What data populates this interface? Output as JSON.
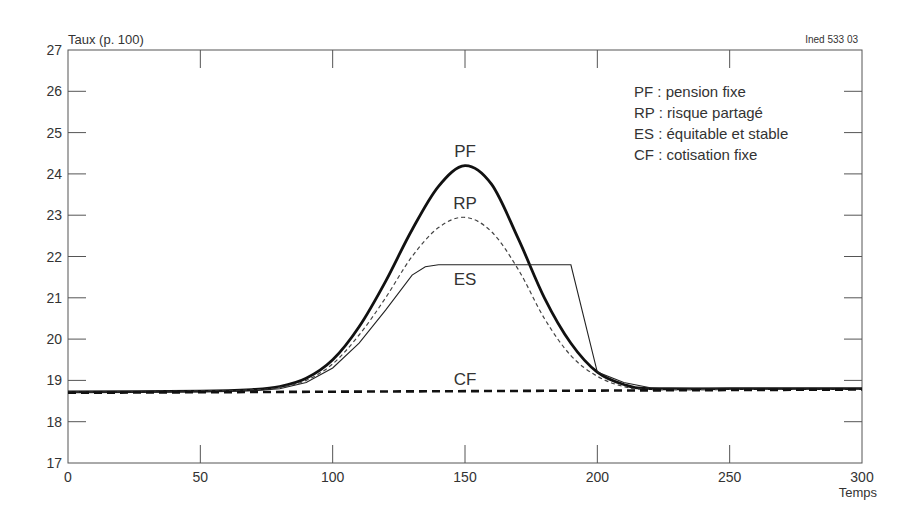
{
  "chart_data": {
    "type": "line",
    "title": "",
    "ylabel": "Taux (p. 100)",
    "xlabel": "Temps",
    "source_note": "Ined 533 03",
    "xlim": [
      0,
      300
    ],
    "ylim": [
      17,
      27
    ],
    "xticks": [
      0,
      50,
      100,
      150,
      200,
      250,
      300
    ],
    "yticks": [
      17,
      18,
      19,
      20,
      21,
      22,
      23,
      24,
      25,
      26,
      27
    ],
    "grid": false,
    "legend_position": "top-right",
    "legend": [
      "PF : pension fixe",
      "RP : risque partagé",
      "ES : équitable et stable",
      "CF : cotisation fixe"
    ],
    "series": [
      {
        "name": "PF",
        "label": "pension fixe",
        "style": "thick-solid",
        "x": [
          0,
          50,
          70,
          80,
          90,
          100,
          110,
          120,
          130,
          140,
          150,
          160,
          170,
          180,
          190,
          200,
          210,
          220,
          250,
          300
        ],
        "values": [
          18.72,
          18.74,
          18.78,
          18.85,
          19.05,
          19.5,
          20.3,
          21.4,
          22.65,
          23.7,
          24.2,
          23.75,
          22.45,
          21.0,
          19.9,
          19.2,
          18.9,
          18.8,
          18.8,
          18.8
        ]
      },
      {
        "name": "RP",
        "label": "risque partagé",
        "style": "thin-dashed",
        "x": [
          0,
          50,
          70,
          80,
          90,
          100,
          110,
          120,
          130,
          140,
          150,
          160,
          170,
          180,
          190,
          200,
          210,
          220,
          250,
          300
        ],
        "values": [
          18.72,
          18.74,
          18.77,
          18.83,
          19.0,
          19.4,
          20.1,
          21.0,
          22.0,
          22.7,
          22.95,
          22.6,
          21.7,
          20.5,
          19.6,
          19.1,
          18.85,
          18.78,
          18.78,
          18.78
        ]
      },
      {
        "name": "ES",
        "label": "équitable et stable",
        "style": "thin-solid",
        "x": [
          0,
          50,
          70,
          80,
          90,
          100,
          110,
          120,
          130,
          135,
          140,
          150,
          160,
          170,
          180,
          190,
          200,
          210,
          220,
          250,
          300
        ],
        "values": [
          18.72,
          18.73,
          18.75,
          18.8,
          18.95,
          19.3,
          19.9,
          20.7,
          21.55,
          21.75,
          21.8,
          21.8,
          21.8,
          21.8,
          21.8,
          21.8,
          19.2,
          18.95,
          18.82,
          18.8,
          18.8
        ]
      },
      {
        "name": "CF",
        "label": "cotisation fixe",
        "style": "thick-dashed",
        "x": [
          0,
          300
        ],
        "values": [
          18.7,
          18.78
        ]
      }
    ],
    "annotations": [
      {
        "text": "PF",
        "x": 150,
        "y": 24.4
      },
      {
        "text": "RP",
        "x": 150,
        "y": 23.15
      },
      {
        "text": "ES",
        "x": 150,
        "y": 21.3
      },
      {
        "text": "CF",
        "x": 150,
        "y": 18.9
      }
    ]
  }
}
